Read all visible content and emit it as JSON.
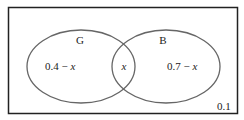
{
  "diagram": {
    "type": "venn",
    "universe_value": "0.1",
    "sets": [
      {
        "name": "G",
        "label": "G",
        "only_region": "0.4 − x"
      },
      {
        "name": "B",
        "label": "B",
        "only_region": "0.7 − x"
      }
    ],
    "intersection": "x",
    "colors": {
      "stroke": "#555555",
      "border": "#222222",
      "text": "#222222"
    }
  }
}
